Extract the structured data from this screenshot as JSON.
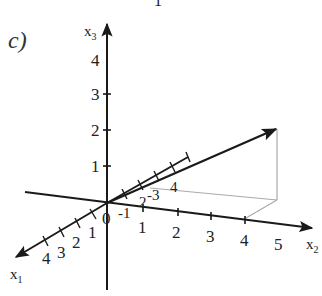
{
  "figure": {
    "part_label": "c)",
    "top_cut_glyph": "1",
    "axes": {
      "x1": {
        "name": "x",
        "sub": "1",
        "tick_labels": [
          "1",
          "2",
          "3",
          "4"
        ],
        "negative_tick_labels": [
          "-1",
          "-2",
          "-3",
          "-4"
        ]
      },
      "x2": {
        "name": "x",
        "sub": "2",
        "tick_labels": [
          "1",
          "2",
          "3",
          "4",
          "5"
        ]
      },
      "x3": {
        "name": "x",
        "sub": "3",
        "tick_labels": [
          "1",
          "2",
          "3",
          "4"
        ]
      }
    },
    "origin_label": "0",
    "neg_labels": {
      "n1": "-1",
      "n2": "2",
      "n3": "-3",
      "n4": "4"
    },
    "vector": {
      "description": "position vector from origin with projection lines",
      "color": "#222222"
    },
    "colors": {
      "axis": "#1a1a1a",
      "projection": "#aaaaaa"
    }
  }
}
